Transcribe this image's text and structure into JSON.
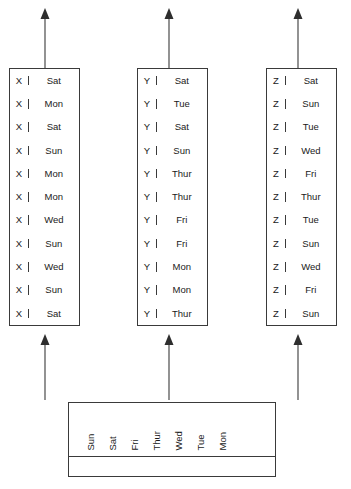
{
  "diagram": {
    "columns": [
      {
        "name": "column-x",
        "key": "X",
        "rows": [
          {
            "key": "X",
            "value": "Sat"
          },
          {
            "key": "X",
            "value": "Mon"
          },
          {
            "key": "X",
            "value": "Sat"
          },
          {
            "key": "X",
            "value": "Sun"
          },
          {
            "key": "X",
            "value": "Mon"
          },
          {
            "key": "X",
            "value": "Mon"
          },
          {
            "key": "X",
            "value": "Wed"
          },
          {
            "key": "X",
            "value": "Sun"
          },
          {
            "key": "X",
            "value": "Wed"
          },
          {
            "key": "X",
            "value": "Sun"
          },
          {
            "key": "X",
            "value": "Sat"
          }
        ]
      },
      {
        "name": "column-y",
        "key": "Y",
        "rows": [
          {
            "key": "Y",
            "value": "Sat"
          },
          {
            "key": "Y",
            "value": "Tue"
          },
          {
            "key": "Y",
            "value": "Sat"
          },
          {
            "key": "Y",
            "value": "Sun"
          },
          {
            "key": "Y",
            "value": "Thur"
          },
          {
            "key": "Y",
            "value": "Thur"
          },
          {
            "key": "Y",
            "value": "Fri"
          },
          {
            "key": "Y",
            "value": "Fri"
          },
          {
            "key": "Y",
            "value": "Mon"
          },
          {
            "key": "Y",
            "value": "Mon"
          },
          {
            "key": "Y",
            "value": "Thur"
          }
        ]
      },
      {
        "name": "column-z",
        "key": "Z",
        "rows": [
          {
            "key": "Z",
            "value": "Sat"
          },
          {
            "key": "Z",
            "value": "Sun"
          },
          {
            "key": "Z",
            "value": "Tue"
          },
          {
            "key": "Z",
            "value": "Wed"
          },
          {
            "key": "Z",
            "value": "Fri"
          },
          {
            "key": "Z",
            "value": "Thur"
          },
          {
            "key": "Z",
            "value": "Tue"
          },
          {
            "key": "Z",
            "value": "Sun"
          },
          {
            "key": "Z",
            "value": "Wed"
          },
          {
            "key": "Z",
            "value": "Fri"
          },
          {
            "key": "Z",
            "value": "Sun"
          }
        ]
      }
    ],
    "source": {
      "name": "source-table",
      "labels": [
        "Sun",
        "Sat",
        "Fri",
        "Thur",
        "Wed",
        "Tue",
        "Mon"
      ],
      "empty_row": ""
    },
    "arrows": {
      "top": [
        "arrow-up-out-x",
        "arrow-up-out-y",
        "arrow-up-out-z"
      ],
      "bottom": [
        "arrow-up-in-x",
        "arrow-up-in-y",
        "arrow-up-in-z"
      ]
    },
    "colors": {
      "line": "#3a3a3a",
      "arrow": "#4a4a4a",
      "text": "#1a1a1a",
      "background": "#ffffff"
    }
  }
}
